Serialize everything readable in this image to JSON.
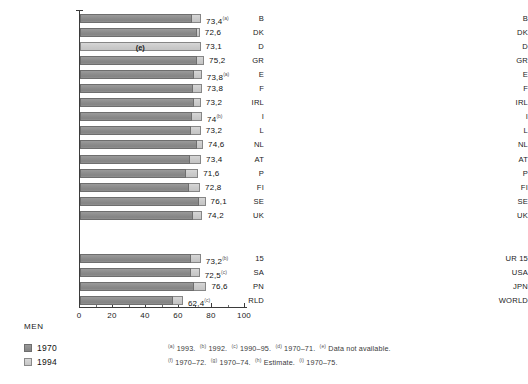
{
  "chart_data": {
    "type": "bar",
    "title": "",
    "orientation": "horizontal",
    "xlabel": "",
    "ylabel": "",
    "xlim": [
      0,
      100
    ],
    "xticks": [
      0,
      20,
      40,
      60,
      80,
      100
    ],
    "xtick_labels": [
      "0",
      "20",
      "40",
      "60",
      "80",
      "100"
    ],
    "minor_tick_step": 10,
    "grid": false,
    "stacked_display": "1970 value drawn dark, 1994 value drawn as light extension to total",
    "legend": {
      "position": "bottom-left",
      "entries": [
        {
          "label": "1970",
          "color": "#8e8e8e"
        },
        {
          "label": "1994",
          "color": "#cccccc"
        }
      ]
    },
    "panels": [
      {
        "name": "MEN",
        "caption": "MEN",
        "groups": [
          {
            "name": "eu-members",
            "categories": [
              "B",
              "DK",
              "D",
              "GR",
              "E",
              "F",
              "IRL",
              "I",
              "L",
              "NL",
              "AT",
              "P",
              "FI",
              "SE",
              "UK"
            ],
            "values_1994": [
              73.4,
              72.6,
              73.1,
              75.2,
              73.8,
              73.8,
              73.2,
              74.0,
              73.2,
              74.6,
              73.4,
              71.6,
              72.8,
              76.1,
              74.2
            ],
            "values_1970": [
              67.8,
              70.7,
              null,
              71.2,
              69.2,
              68.4,
              68.8,
              67.9,
              67.1,
              70.7,
              66.5,
              64.2,
              65.9,
              72.2,
              68.7
            ],
            "value_labels": [
              "73,4",
              "72,6",
              "73,1",
              "75,2",
              "73,8",
              "73,8",
              "73,2",
              "74",
              "73,2",
              "74,6",
              "73,4",
              "71,6",
              "72,8",
              "76,1",
              "74,2"
            ],
            "footnote_marks": [
              "a",
              "",
              "",
              "",
              "a",
              "",
              "",
              "b",
              "",
              "",
              "",
              "",
              "",
              "",
              ""
            ],
            "estimate_flags": [
              false,
              false,
              true,
              false,
              false,
              false,
              false,
              false,
              false,
              false,
              false,
              false,
              false,
              false,
              false
            ],
            "estimate_label": "(e)"
          },
          {
            "name": "aggregates",
            "categories": [
              "EUR 15",
              "USA",
              "JPN",
              "WORLD"
            ],
            "categories_clipped": [
              "15",
              "SA",
              "PN",
              "RLD"
            ],
            "values_1994": [
              73.2,
              72.5,
              76.6,
              62.4
            ],
            "values_1970": [
              67.5,
              67.1,
              69.3,
              56.5
            ],
            "value_labels": [
              "73,2",
              "72,5",
              "76,6",
              "62,4"
            ],
            "footnote_marks": [
              "b",
              "c",
              "",
              "c"
            ],
            "estimate_flags": [
              false,
              false,
              false,
              false
            ]
          }
        ]
      },
      {
        "name": "WOMEN",
        "caption": "WOMEN",
        "groups": [
          {
            "name": "eu-members",
            "categories": [
              "B",
              "DK",
              "D",
              "GR",
              "E",
              "F",
              "IRL",
              "I",
              "L",
              "NL",
              "AT",
              "P",
              "FI",
              "SE",
              "UK"
            ],
            "values_1994": [
              80.1,
              77.8,
              79.6,
              80.2,
              81.1,
              81.9,
              78.7,
              80.6,
              79.7,
              80.3,
              79.7,
              78.6,
              80.1,
              81.4,
              79.4
            ],
            "values_1970": [
              74.2,
              75.9,
              null,
              74.2,
              74.8,
              75.9,
              73.0,
              74.1,
              73.4,
              76.5,
              73.4,
              70.8,
              73.6,
              77.1,
              75.0
            ],
            "value_labels": [
              "80,1",
              "77,8",
              "79,6",
              "80,2",
              "81,1",
              "81,9",
              "78,7",
              "80,6",
              "79,7",
              "80,3",
              "79,7",
              "78,6",
              "80,1",
              "81,4",
              "79,4"
            ],
            "footnote_marks": [
              "a",
              "",
              "",
              "",
              "a",
              "",
              "",
              "b",
              "",
              "",
              "",
              "",
              "",
              "",
              ""
            ],
            "estimate_flags": [
              false,
              false,
              true,
              false,
              false,
              false,
              false,
              false,
              false,
              false,
              false,
              false,
              false,
              false,
              false
            ],
            "estimate_label": "(e)"
          },
          {
            "name": "aggregates",
            "categories": [
              "EUR 15",
              "USA",
              "JPN",
              "WORLD"
            ],
            "categories_clipped": [
              "UR 15",
              "USA",
              "JPN",
              "WORLD"
            ],
            "values_1994": [
              79.9,
              79.3,
              83.0,
              66.5
            ],
            "values_1970": [
              74.6,
              74.8,
              74.7,
              59.2
            ],
            "value_labels": [
              "79,9",
              "79,3",
              "83",
              "66,5"
            ],
            "footnote_marks": [
              "b",
              "d",
              "",
              "c"
            ],
            "estimate_flags": [
              false,
              false,
              false,
              false
            ]
          }
        ]
      }
    ],
    "footnotes": [
      {
        "mark": "a",
        "text": "1993."
      },
      {
        "mark": "b",
        "text": "1992."
      },
      {
        "mark": "c",
        "text": "1990–95."
      },
      {
        "mark": "d",
        "text": "1970–71."
      },
      {
        "mark": "e",
        "text": "Data not available."
      },
      {
        "mark": "f",
        "text": "1970–72."
      },
      {
        "mark": "g",
        "text": "1970–74."
      },
      {
        "mark": "h",
        "text": "Estimate."
      },
      {
        "mark": "i",
        "text": "1970–75."
      }
    ]
  }
}
